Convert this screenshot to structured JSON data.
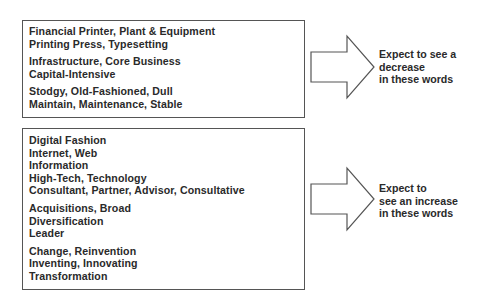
{
  "boxes": [
    {
      "groups": [
        [
          "Financial Printer, Plant & Equipment",
          "Printing Press, Typesetting"
        ],
        [
          "Infrastructure, Core Business",
          "Capital-Intensive"
        ],
        [
          "Stodgy, Old-Fashioned, Dull",
          "Maintain, Maintenance, Stable"
        ]
      ],
      "arrow_label": [
        "Expect to see a",
        "decrease",
        "in these words"
      ]
    },
    {
      "groups": [
        [
          "Digital Fashion",
          "Internet, Web",
          "Information",
          "High-Tech, Technology",
          "Consultant, Partner, Advisor, Consultative"
        ],
        [
          "Acquisitions, Broad",
          "Diversification",
          "Leader"
        ],
        [
          "Change, Reinvention",
          "Inventing, Innovating",
          "Transformation"
        ]
      ],
      "arrow_label": [
        "Expect to",
        "see an increase",
        "in these words"
      ]
    }
  ],
  "colors": {
    "stroke": "#555555",
    "text": "#2a2a2a",
    "background": "#ffffff"
  }
}
